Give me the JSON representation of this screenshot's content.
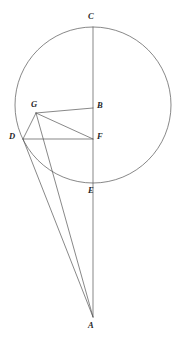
{
  "figure": {
    "canvas": {
      "width": 178,
      "height": 352
    },
    "colors": {
      "stroke": "#555555",
      "label": "#262626",
      "background": "#ffffff"
    },
    "circle": {
      "name": "main-circle",
      "cx": 93,
      "cy": 105,
      "r": 78
    },
    "points": [
      {
        "id": "C",
        "label": "C",
        "x": 93,
        "y": 27,
        "label_x": 88,
        "label_y": 12
      },
      {
        "id": "B",
        "label": "B",
        "x": 93,
        "y": 108,
        "label_x": 97,
        "label_y": 101
      },
      {
        "id": "G",
        "label": "G",
        "x": 36,
        "y": 113,
        "label_x": 31,
        "label_y": 100
      },
      {
        "id": "D",
        "label": "D",
        "x": 23,
        "y": 139,
        "label_x": 9,
        "label_y": 132
      },
      {
        "id": "F",
        "label": "F",
        "x": 93,
        "y": 139,
        "label_x": 97,
        "label_y": 132
      },
      {
        "id": "E",
        "label": "E",
        "x": 93,
        "y": 183,
        "label_x": 88,
        "label_y": 186
      },
      {
        "id": "A",
        "label": "A",
        "x": 93,
        "y": 317,
        "label_x": 88,
        "label_y": 321
      }
    ],
    "segments": [
      {
        "id": "CA",
        "name": "vertical-axis-C-to-A",
        "from": "C",
        "to": "A"
      },
      {
        "id": "DG",
        "name": "segment-D-G",
        "from": "D",
        "to": "G"
      },
      {
        "id": "GF",
        "name": "segment-G-F",
        "from": "G",
        "to": "F"
      },
      {
        "id": "GB",
        "name": "segment-G-B",
        "from": "G",
        "to": "B"
      },
      {
        "id": "DF",
        "name": "segment-D-F",
        "from": "D",
        "to": "F"
      },
      {
        "id": "DA",
        "name": "segment-D-A",
        "from": "D",
        "to": "A"
      },
      {
        "id": "GA",
        "name": "segment-G-A",
        "from": "G",
        "to": "A"
      }
    ]
  }
}
